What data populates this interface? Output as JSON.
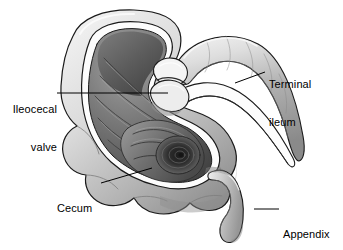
{
  "figure": {
    "name": "ileocecal-region-anatomy",
    "type": "grayscale-medical-illustration",
    "background_color": "#ffffff",
    "palette": {
      "outline": "#1a1a1a",
      "serosa_light": "#e8e8e8",
      "serosa_mid": "#c2c2c2",
      "serosa_shadow": "#8f8f8f",
      "cut_edge_white": "#fdfdfd",
      "mucosa_light": "#9a9a9a",
      "mucosa_mid": "#6e6e6e",
      "mucosa_dark": "#3f3f3f",
      "mucosa_deepest": "#1f1f1f",
      "leader_line": "#000000",
      "label_text": "#000000"
    }
  },
  "labels": [
    {
      "id": "ileocecal-valve",
      "lines": [
        "Ileocecal",
        "valve"
      ],
      "text": "Ileocecal valve",
      "align": "right",
      "x": 5,
      "y": 78,
      "leader": {
        "x1": 57,
        "y1": 93,
        "x2": 168,
        "y2": 93
      }
    },
    {
      "id": "terminal-ileum",
      "lines": [
        "Terminal",
        "ileum"
      ],
      "text": "Terminal ileum",
      "align": "left",
      "x": 269,
      "y": 53,
      "leader": {
        "x1": 265,
        "y1": 72,
        "x2": 235,
        "y2": 83
      }
    },
    {
      "id": "cecum",
      "lines": [
        "Cecum"
      ],
      "text": "Cecum",
      "align": "left",
      "x": 57,
      "y": 177,
      "leader": {
        "x1": 101,
        "y1": 183,
        "x2": 152,
        "y2": 168
      }
    },
    {
      "id": "appendix",
      "lines": [
        "Appendix"
      ],
      "text": "Appendix",
      "align": "left",
      "x": 283,
      "y": 203,
      "leader": {
        "x1": 279,
        "y1": 209,
        "x2": 254,
        "y2": 209
      }
    }
  ],
  "structures": [
    {
      "id": "cecum-wall",
      "name": "cecum outer wall (serosa)"
    },
    {
      "id": "cecum-lumen",
      "name": "cecum interior lumen with mucosal folds"
    },
    {
      "id": "ileocecal-valve-lips",
      "name": "ileocecal valve lips"
    },
    {
      "id": "terminal-ileum-tube",
      "name": "terminal ileum tube"
    },
    {
      "id": "appendix-tube",
      "name": "appendix"
    },
    {
      "id": "haustra",
      "name": "haustral bulges along lower cecum"
    },
    {
      "id": "ascending-colon-lumen",
      "name": "ascending colon opening (upper interior)"
    }
  ]
}
